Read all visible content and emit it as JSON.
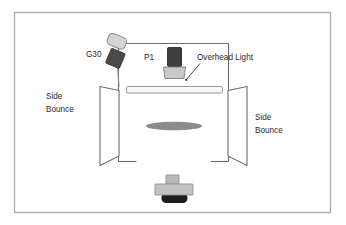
{
  "diagram": {
    "background_color": "#ffffff",
    "border_color": "#a9a9a9",
    "line_color": "#6e6e6e",
    "text_color": "#2b2b2b",
    "labels": {
      "g30": "G30",
      "p1": "P1",
      "overhead_light": "Overhead Light",
      "side_bounce_left_line1": "Side",
      "side_bounce_left_line2": "Bounce",
      "side_bounce_right_line1": "Side",
      "side_bounce_right_line2": "Bounce"
    },
    "elements": {
      "room_walls": {
        "name": "room-walls",
        "stroke": "#6e6e6e"
      },
      "g30_light": {
        "name": "g30-light",
        "head_color": "#d4d4d4",
        "body_color": "#4a4a4a",
        "stand_color": "#8a8a8a"
      },
      "p1_light": {
        "name": "p1-light",
        "head_color": "#3f3f3f",
        "base_color": "#c9c9c9"
      },
      "overhead_light_bar": {
        "name": "overhead-light-bar",
        "fill": "#f7f7f7",
        "stroke": "#9a9a9a"
      },
      "side_bounce_left_panel": {
        "name": "side-bounce-left-panel",
        "fill": "#ffffff",
        "stroke": "#6e6e6e"
      },
      "side_bounce_right_panel": {
        "name": "side-bounce-right-panel",
        "fill": "#ffffff",
        "stroke": "#6e6e6e"
      },
      "subject_ellipse": {
        "name": "subject-ellipse",
        "fill": "#8c8c8c"
      },
      "camera": {
        "name": "camera",
        "viewfinder_color": "#b9b9b9",
        "body_color": "#c2c2c2",
        "lens_color": "#1c1c1c"
      },
      "leader_line": {
        "name": "overhead-light-leader-line",
        "stroke": "#3a3a3a"
      }
    }
  }
}
